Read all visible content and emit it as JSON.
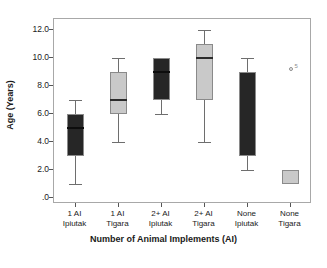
{
  "chart_data": {
    "type": "box",
    "title": "",
    "xlabel": "Number of Animal Implements (AI)",
    "ylabel": "Age (Years)",
    "ylim": [
      0,
      12.6
    ],
    "yticks": [
      "12.0",
      "10.0",
      "8.0",
      "6.0",
      "4.0",
      "2.0",
      ".0"
    ],
    "ytick_values": [
      12.0,
      10.0,
      8.0,
      6.0,
      4.0,
      2.0,
      0.0
    ],
    "grid": false,
    "legend": "none",
    "categories": [
      {
        "line1": "1 AI",
        "line2": "Ipiutak"
      },
      {
        "line1": "1 AI",
        "line2": "Tigara"
      },
      {
        "line1": "2+ AI",
        "line2": "Ipiutak"
      },
      {
        "line1": "2+ AI",
        "line2": "Tigara"
      },
      {
        "line1": "None",
        "line2": "Ipiutak"
      },
      {
        "line1": "None",
        "line2": "Tigara"
      }
    ],
    "boxes": [
      {
        "name": "1 AI Ipiutak",
        "fill": "dark",
        "whisker_low": 1.0,
        "q1": 3.0,
        "median": 5.0,
        "q3": 6.0,
        "whisker_high": 7.0,
        "show_median": true,
        "outliers": []
      },
      {
        "name": "1 AI Tigara",
        "fill": "light",
        "whisker_low": 4.0,
        "q1": 6.0,
        "median": 7.0,
        "q3": 9.0,
        "whisker_high": 10.0,
        "show_median": true,
        "outliers": []
      },
      {
        "name": "2+ AI Ipiutak",
        "fill": "dark",
        "whisker_low": 6.0,
        "q1": 7.0,
        "median": 9.0,
        "q3": 10.0,
        "whisker_high": 10.0,
        "show_median": true,
        "outliers": []
      },
      {
        "name": "2+ AI Tigara",
        "fill": "light",
        "whisker_low": 4.0,
        "q1": 7.0,
        "median": 10.0,
        "q3": 11.0,
        "whisker_high": 12.0,
        "show_median": true,
        "outliers": []
      },
      {
        "name": "None Ipiutak",
        "fill": "dark",
        "whisker_low": 2.0,
        "q1": 3.0,
        "median": 9.0,
        "q3": 9.0,
        "whisker_high": 10.0,
        "show_median": false,
        "outliers": []
      },
      {
        "name": "None Tigara",
        "fill": "light",
        "whisker_low": 1.0,
        "q1": 1.0,
        "median": 1.0,
        "q3": 2.0,
        "whisker_high": 2.0,
        "show_median": false,
        "outliers": [
          {
            "value": 9.2,
            "label": "5"
          }
        ]
      }
    ]
  },
  "colors": {
    "dark_fill": "#262626",
    "light_fill": "#c9c9c9",
    "frame": "#a8a8a8",
    "whisker": "#6e6e6e",
    "text": "#1a1a1a"
  }
}
